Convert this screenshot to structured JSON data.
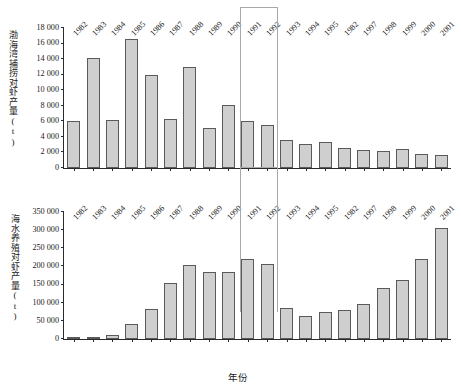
{
  "chart_data": [
    {
      "type": "bar",
      "title": "",
      "panel": "top",
      "ylabel": "渤海湾捕捞对虾产量(t)",
      "xlabel": "",
      "ylim": [
        0,
        18000
      ],
      "ytick_values": [
        0,
        2000,
        4000,
        6000,
        8000,
        10000,
        12000,
        14000,
        16000,
        18000
      ],
      "ytick_labels": [
        "0",
        "2 000",
        "4 000",
        "6 000",
        "8 000",
        "10 000",
        "12 000",
        "14 000",
        "16 000",
        "18 000"
      ],
      "grid": false,
      "legend": "none",
      "categories": [
        "1982",
        "1983",
        "1984",
        "1985",
        "1986",
        "1987",
        "1988",
        "1989",
        "1990",
        "1991",
        "1992",
        "1993",
        "1994",
        "1995",
        "1982",
        "1997",
        "1998",
        "1999",
        "2000",
        "2001"
      ],
      "values": [
        6100,
        14200,
        6200,
        16600,
        11900,
        6250,
        13050,
        5200,
        8150,
        6050,
        5500,
        3600,
        3100,
        3400,
        2600,
        2300,
        2200,
        2450,
        1750,
        1700
      ]
    },
    {
      "type": "bar",
      "title": "",
      "panel": "bottom",
      "ylabel": "海水养殖对虾产量(t)",
      "xlabel": "年份",
      "ylim": [
        0,
        350000
      ],
      "ytick_values": [
        0,
        50000,
        100000,
        150000,
        200000,
        250000,
        300000,
        350000
      ],
      "ytick_labels": [
        "0",
        "50 000",
        "100 000",
        "150 000",
        "200 000",
        "250 000",
        "300 000",
        "350 000"
      ],
      "grid": false,
      "legend": "none",
      "categories": [
        "1982",
        "1983",
        "1984",
        "1985",
        "1986",
        "1987",
        "1988",
        "1989",
        "1990",
        "1991",
        "1992",
        "1993",
        "1994",
        "1995",
        "1982",
        "1997",
        "1998",
        "1999",
        "2000",
        "2001"
      ],
      "values": [
        3000,
        5000,
        12000,
        42000,
        83000,
        155000,
        205000,
        185000,
        185000,
        220000,
        208000,
        85000,
        63000,
        75000,
        80000,
        97000,
        140000,
        162000,
        220000,
        305000
      ]
    }
  ],
  "annotations": {
    "highlight_box": {
      "name": "highlight-rectangle",
      "spans_years": [
        "1991",
        "1992"
      ],
      "color": "#a9a9a9"
    }
  },
  "style": {
    "bar_fill": "#cfcfcf",
    "bar_stroke": "#5a5a5a",
    "axis_color": "#2b2b2b",
    "text_color": "#1a1a1a",
    "background": "#ffffff"
  }
}
